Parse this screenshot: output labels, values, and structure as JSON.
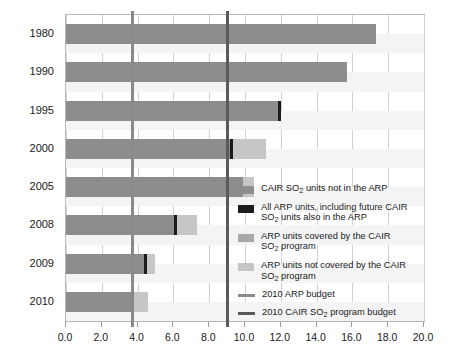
{
  "chart_data": {
    "type": "bar",
    "orientation": "horizontal",
    "stacked": true,
    "title": "",
    "xlabel": "",
    "ylabel": "",
    "xlim": [
      0.0,
      20.0
    ],
    "xticks": [
      "0.0",
      "2.0",
      "4.0",
      "6.0",
      "8.0",
      "10.0",
      "12.0",
      "14.0",
      "16.0",
      "18.0",
      "20.0"
    ],
    "xtick_values": [
      0,
      2,
      4,
      6,
      8,
      10,
      12,
      14,
      16,
      18,
      20
    ],
    "grid": true,
    "legend_position": "right",
    "categories": [
      "1980",
      "1990",
      "1995",
      "2000",
      "2005",
      "2008",
      "2009",
      "2010"
    ],
    "series": [
      {
        "name": "CAIR SO2 units not in the ARP",
        "color": "#8d8d8d",
        "values": [
          17.3,
          15.7,
          11.9,
          9.2,
          9.9,
          6.1,
          4.4,
          3.7
        ]
      },
      {
        "name": "ARP units not covered by the CAIR SO2 program",
        "color": "#c6c6c6",
        "values": [
          0.0,
          0.0,
          0.0,
          2.0,
          0.6,
          1.2,
          0.6,
          0.9
        ]
      }
    ],
    "markers": [
      {
        "name": "All ARP units, including future CAIR SO2 units also in the ARP",
        "color": "#1b1b1b",
        "values": [
          null,
          null,
          11.9,
          9.2,
          null,
          6.1,
          4.4,
          3.7
        ]
      }
    ],
    "reference_lines": [
      {
        "name": "2010 ARP budget",
        "value": 3.7,
        "color": "#8a8a8a"
      },
      {
        "name": "2010 CAIR SO2 program budget",
        "value": 9.0,
        "color": "#5a5a5a"
      }
    ]
  },
  "legend": {
    "items": [
      {
        "swatch_type": "box",
        "color": "#8d8d8d",
        "line1_a": "CAIR SO",
        "line1_sub": "2",
        "line1_b": " units not in the ARP",
        "line2_a": "",
        "line2_sub": "",
        "line2_b": ""
      },
      {
        "swatch_type": "box",
        "color": "#1b1b1b",
        "line1_a": "All ARP units, including future CAIR",
        "line1_sub": "",
        "line1_b": "",
        "line2_a": "SO",
        "line2_sub": "2",
        "line2_b": " units also in the ARP"
      },
      {
        "swatch_type": "box",
        "color": "#a8a8a8",
        "line1_a": "ARP units covered by the CAIR",
        "line1_sub": "",
        "line1_b": "",
        "line2_a": "SO",
        "line2_sub": "2",
        "line2_b": " program"
      },
      {
        "swatch_type": "box",
        "color": "#c6c6c6",
        "line1_a": "ARP units not covered by the CAIR",
        "line1_sub": "",
        "line1_b": "",
        "line2_a": "SO",
        "line2_sub": "2",
        "line2_b": " program"
      },
      {
        "swatch_type": "line",
        "color": "#8a8a8a",
        "line1_a": "2010 ARP budget",
        "line1_sub": "",
        "line1_b": "",
        "line2_a": "",
        "line2_sub": "",
        "line2_b": ""
      },
      {
        "swatch_type": "line",
        "color": "#5a5a5a",
        "line1_a": "2010 CAIR SO",
        "line1_sub": "2",
        "line1_b": " program budget",
        "line2_a": "",
        "line2_sub": "",
        "line2_b": ""
      }
    ]
  }
}
